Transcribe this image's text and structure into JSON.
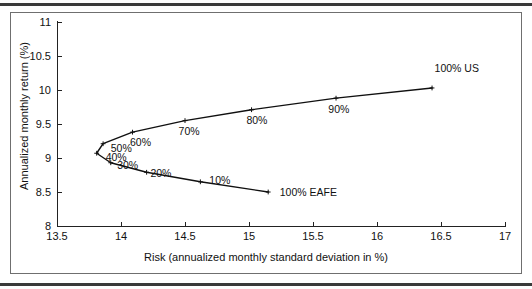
{
  "chart_data": {
    "type": "line",
    "title": "",
    "xlabel": "Risk (annualized monthly standard deviation in %)",
    "ylabel": "Annualized monthly return (%)",
    "xlim": [
      13.5,
      17
    ],
    "ylim": [
      8,
      11
    ],
    "xticks": [
      "13.5",
      "14",
      "14.5",
      "15",
      "15.5",
      "16",
      "16.5",
      "17"
    ],
    "xtick_values": [
      13.5,
      14,
      14.5,
      15,
      15.5,
      16,
      16.5,
      17
    ],
    "yticks": [
      "8",
      "8.5",
      "9",
      "9.5",
      "10",
      "10.5",
      "11"
    ],
    "ytick_values": [
      8,
      8.5,
      9,
      9.5,
      10,
      10.5,
      11
    ],
    "grid": false,
    "legend": "none",
    "series": [
      {
        "name": "Efficient frontier (US / EAFE mix)",
        "points": [
          {
            "label": "100% EAFE",
            "x": 15.15,
            "y": 8.5,
            "weight_us": 0
          },
          {
            "label": "10%",
            "x": 14.62,
            "y": 8.65,
            "weight_us": 10
          },
          {
            "label": "20%",
            "x": 14.2,
            "y": 8.79,
            "weight_us": 20
          },
          {
            "label": "30%",
            "x": 13.92,
            "y": 8.93,
            "weight_us": 30
          },
          {
            "label": "40%",
            "x": 13.81,
            "y": 9.07,
            "weight_us": 40
          },
          {
            "label": "50%",
            "x": 13.86,
            "y": 9.21,
            "weight_us": 50
          },
          {
            "label": "60%",
            "x": 14.09,
            "y": 9.38,
            "weight_us": 60
          },
          {
            "label": "70%",
            "x": 14.5,
            "y": 9.55,
            "weight_us": 70
          },
          {
            "label": "80%",
            "x": 15.02,
            "y": 9.71,
            "weight_us": 80
          },
          {
            "label": "90%",
            "x": 15.68,
            "y": 9.88,
            "weight_us": 90
          },
          {
            "label": "100% US",
            "x": 16.43,
            "y": 10.03,
            "weight_us": 100
          }
        ]
      }
    ],
    "annotations": [
      {
        "text": "100% US",
        "x": 16.45,
        "y": 10.32
      },
      {
        "text": "90%",
        "x": 15.62,
        "y": 9.72
      },
      {
        "text": "80%",
        "x": 14.98,
        "y": 9.56
      },
      {
        "text": "70%",
        "x": 14.45,
        "y": 9.39
      },
      {
        "text": "60%",
        "x": 14.07,
        "y": 9.23
      },
      {
        "text": "50%",
        "x": 13.92,
        "y": 9.14
      },
      {
        "text": "40%",
        "x": 13.88,
        "y": 9.02
      },
      {
        "text": "30%",
        "x": 13.97,
        "y": 8.9
      },
      {
        "text": "20%",
        "x": 14.23,
        "y": 8.78
      },
      {
        "text": "10%",
        "x": 14.69,
        "y": 8.67
      },
      {
        "text": "100% EAFE",
        "x": 15.24,
        "y": 8.5
      }
    ],
    "colors": {
      "line": "#101010",
      "axis": "#222222",
      "text": "#111111",
      "frame": "#6f6f6f",
      "rule": "#3a3a3a"
    }
  }
}
